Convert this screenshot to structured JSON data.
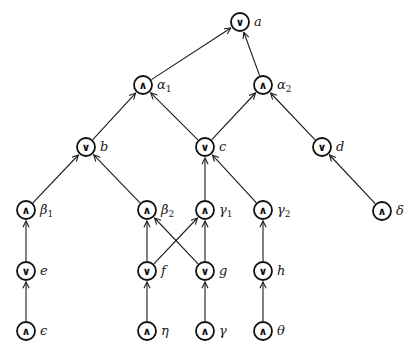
{
  "diagram": {
    "title": "",
    "node_radius": 9,
    "colors": {
      "stroke": "#111111",
      "background": "#ffffff"
    },
    "nodes": [
      {
        "id": "a",
        "op": "∨",
        "label": "a",
        "sub": "",
        "x": 240,
        "y": 22
      },
      {
        "id": "alpha1",
        "op": "∧",
        "label": "α",
        "sub": "1",
        "x": 143,
        "y": 85
      },
      {
        "id": "alpha2",
        "op": "∧",
        "label": "α",
        "sub": "2",
        "x": 263,
        "y": 85
      },
      {
        "id": "b",
        "op": "∨",
        "label": "b",
        "sub": "",
        "x": 86,
        "y": 147
      },
      {
        "id": "c",
        "op": "∨",
        "label": "c",
        "sub": "",
        "x": 205,
        "y": 147
      },
      {
        "id": "d",
        "op": "∨",
        "label": "d",
        "sub": "",
        "x": 322,
        "y": 147
      },
      {
        "id": "beta1",
        "op": "∧",
        "label": "β",
        "sub": "1",
        "x": 26,
        "y": 210
      },
      {
        "id": "beta2",
        "op": "∧",
        "label": "β",
        "sub": "2",
        "x": 147,
        "y": 210
      },
      {
        "id": "gamma1",
        "op": "∧",
        "label": "γ",
        "sub": "1",
        "x": 205,
        "y": 210
      },
      {
        "id": "gamma2",
        "op": "∧",
        "label": "γ",
        "sub": "2",
        "x": 263,
        "y": 210
      },
      {
        "id": "delta",
        "op": "∧",
        "label": "δ",
        "sub": "",
        "x": 382,
        "y": 211
      },
      {
        "id": "e",
        "op": "∨",
        "label": "e",
        "sub": "",
        "x": 26,
        "y": 271
      },
      {
        "id": "f",
        "op": "∨",
        "label": "f",
        "sub": "",
        "x": 147,
        "y": 271
      },
      {
        "id": "g",
        "op": "∨",
        "label": "g",
        "sub": "",
        "x": 205,
        "y": 271
      },
      {
        "id": "h",
        "op": "∨",
        "label": "h",
        "sub": "",
        "x": 263,
        "y": 271
      },
      {
        "id": "epsilon",
        "op": "∧",
        "label": "ϵ",
        "sub": "",
        "x": 26,
        "y": 331
      },
      {
        "id": "eta",
        "op": "∧",
        "label": "η",
        "sub": "",
        "x": 147,
        "y": 331
      },
      {
        "id": "gamma",
        "op": "∧",
        "label": "γ",
        "sub": "",
        "x": 205,
        "y": 331
      },
      {
        "id": "theta",
        "op": "∧",
        "label": "θ",
        "sub": "",
        "x": 263,
        "y": 331
      }
    ],
    "edges": [
      {
        "from": "alpha1",
        "to": "a"
      },
      {
        "from": "alpha2",
        "to": "a"
      },
      {
        "from": "b",
        "to": "alpha1"
      },
      {
        "from": "c",
        "to": "alpha1"
      },
      {
        "from": "c",
        "to": "alpha2"
      },
      {
        "from": "d",
        "to": "alpha2"
      },
      {
        "from": "beta1",
        "to": "b"
      },
      {
        "from": "beta2",
        "to": "b"
      },
      {
        "from": "gamma1",
        "to": "c"
      },
      {
        "from": "gamma2",
        "to": "c"
      },
      {
        "from": "delta",
        "to": "d"
      },
      {
        "from": "e",
        "to": "beta1"
      },
      {
        "from": "f",
        "to": "beta2"
      },
      {
        "from": "f",
        "to": "gamma1"
      },
      {
        "from": "g",
        "to": "beta2"
      },
      {
        "from": "g",
        "to": "gamma1"
      },
      {
        "from": "h",
        "to": "gamma2"
      },
      {
        "from": "epsilon",
        "to": "e"
      },
      {
        "from": "eta",
        "to": "f"
      },
      {
        "from": "gamma",
        "to": "g"
      },
      {
        "from": "theta",
        "to": "h"
      }
    ]
  }
}
